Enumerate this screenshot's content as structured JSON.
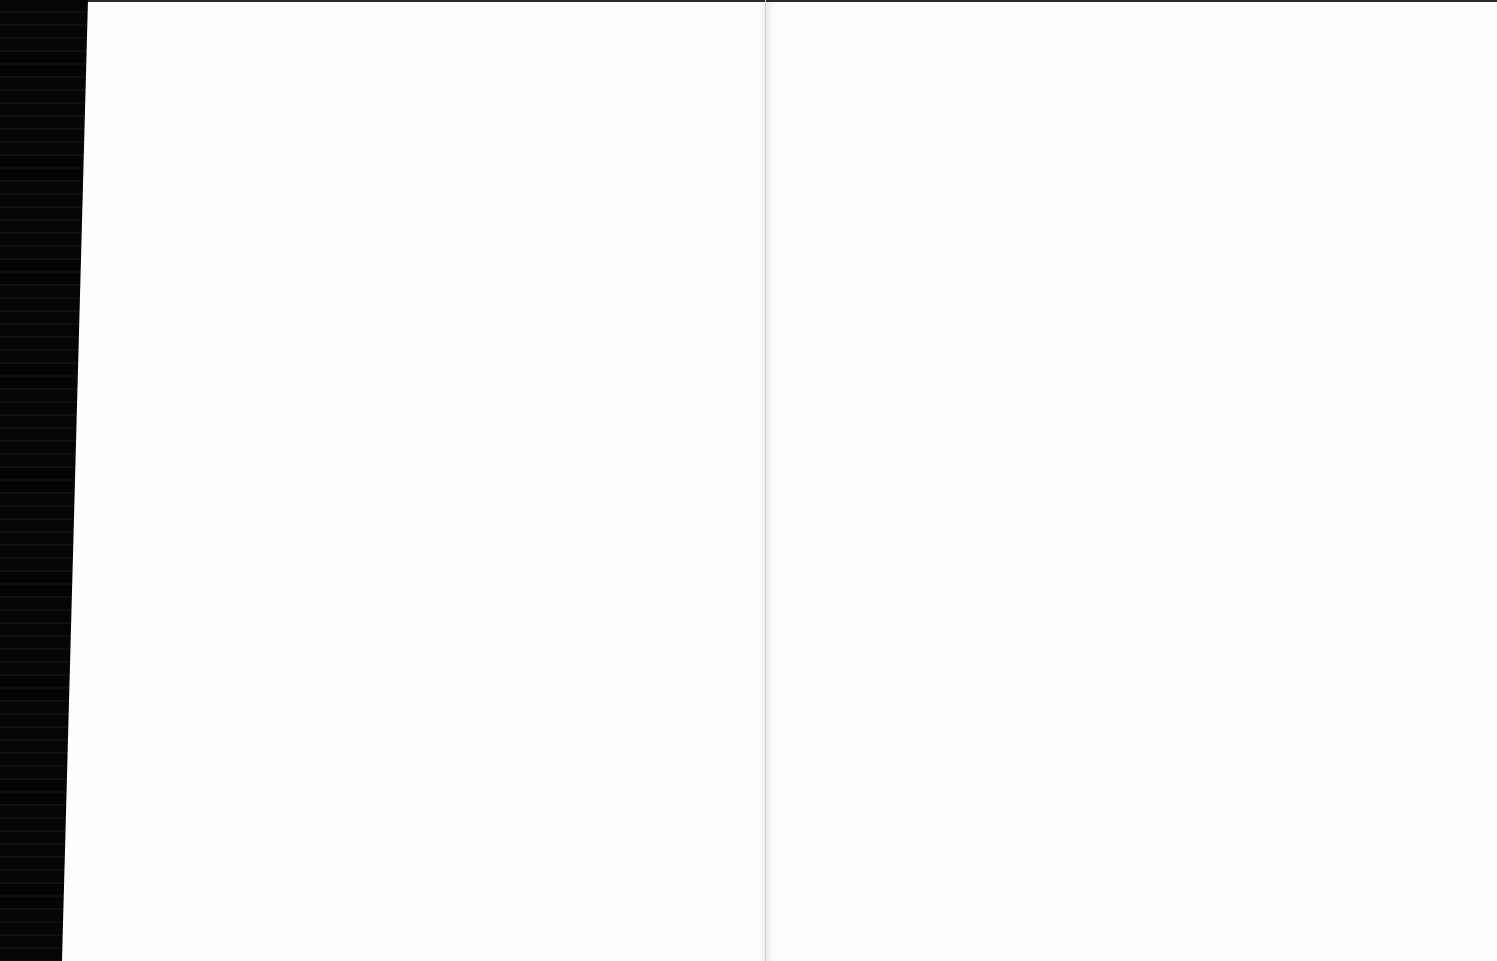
{
  "document": {
    "type": "scanned book spread",
    "pages": [
      {
        "side": "left",
        "text": ""
      },
      {
        "side": "right",
        "text": ""
      }
    ],
    "colors": {
      "background": "#000000",
      "paper": "#fefefe",
      "gutter": "#c8c8c8"
    }
  }
}
